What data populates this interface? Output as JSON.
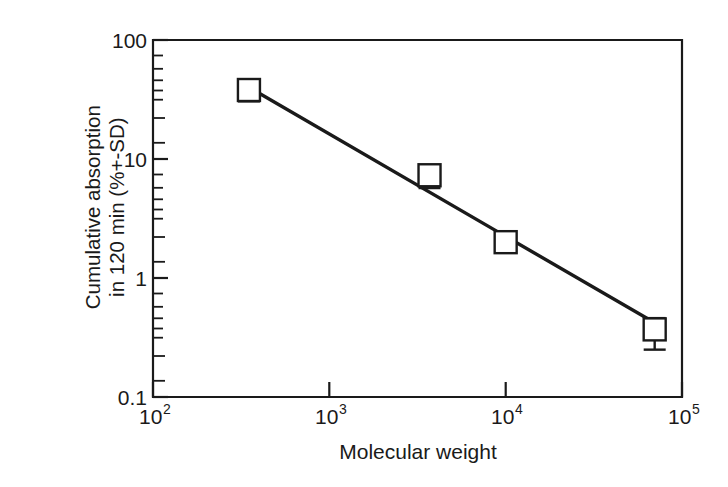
{
  "figure": {
    "background_color": "#ffffff",
    "ink_color": "#1a1a1a"
  },
  "axis": {
    "y_title_line1": "Cumulative absorption",
    "y_title_line2": "in 120 min (%+-SD)",
    "x_title": "Molecular weight",
    "y_ticks": [
      {
        "label": "100",
        "value": 100
      },
      {
        "label": "10",
        "value": 10
      },
      {
        "label": "1",
        "value": 1
      },
      {
        "label": "0.1",
        "value": 0.1
      }
    ],
    "x_ticks": [
      {
        "base": "10",
        "exp": "2",
        "value": 100
      },
      {
        "base": "10",
        "exp": "3",
        "value": 1000
      },
      {
        "base": "10",
        "exp": "4",
        "value": 10000
      },
      {
        "base": "10",
        "exp": "5",
        "value": 100000
      }
    ]
  },
  "chart_data": {
    "type": "scatter",
    "title": "",
    "subtitle": "",
    "xlabel": "Molecular weight",
    "ylabel": "Cumulative absorption in 120 min (%+-SD)",
    "xscale": "log",
    "yscale": "log",
    "xlim": [
      100,
      100000
    ],
    "ylim": [
      0.1,
      100
    ],
    "grid": false,
    "legend": "none",
    "marker": "open-square",
    "x": [
      350,
      3700,
      10000,
      70000
    ],
    "y": [
      38,
      7.3,
      2.0,
      0.37
    ],
    "yerr_low": [
      7.5,
      1.6,
      0.0,
      0.12
    ],
    "yerr_high": [
      8.0,
      1.5,
      0.0,
      0.09
    ],
    "series": [
      {
        "name": "Cumulative absorption",
        "points": [
          {
            "x": 350,
            "y": 38,
            "err_low": 7.5,
            "err_high": 8.0
          },
          {
            "x": 3700,
            "y": 7.3,
            "err_low": 1.6,
            "err_high": 1.5
          },
          {
            "x": 10000,
            "y": 2.0,
            "err_low": 0,
            "err_high": 0
          },
          {
            "x": 70000,
            "y": 0.37,
            "err_low": 0.12,
            "err_high": 0.09
          }
        ]
      }
    ],
    "fit_line": {
      "type": "power-law",
      "x_start": 350,
      "y_start": 40,
      "x_end": 70000,
      "y_end": 0.42
    }
  }
}
